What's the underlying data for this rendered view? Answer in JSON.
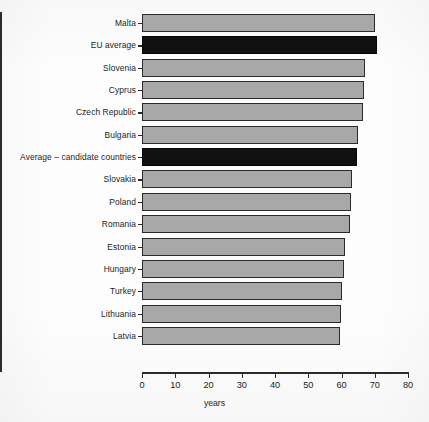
{
  "chart_data": {
    "type": "bar",
    "orientation": "horizontal",
    "title": "",
    "xlabel": "years",
    "ylabel": "",
    "xlim": [
      0,
      80
    ],
    "xticks": [
      0,
      10,
      20,
      30,
      40,
      50,
      60,
      70,
      80
    ],
    "grid": false,
    "legend": null,
    "categories": [
      "Malta",
      "EU average",
      "Slovenia",
      "Cyprus",
      "Czech Republic",
      "Bulgaria",
      "Average – candidate countries",
      "Slovakia",
      "Poland",
      "Romania",
      "Estonia",
      "Hungary",
      "Turkey",
      "Lithuania",
      "Latvia"
    ],
    "values": [
      70.2,
      70.6,
      67.2,
      66.9,
      66.4,
      64.9,
      64.8,
      63.1,
      62.8,
      62.5,
      61.2,
      60.7,
      60.1,
      59.8,
      59.4
    ],
    "highlight": [
      "EU average",
      "Average – candidate countries"
    ],
    "colors": {
      "bar": "#a8a8a8",
      "highlight_bar": "#111111",
      "bar_border": "#2b2b2b",
      "axis": "#2b2b2b",
      "background": "#fdfdfd",
      "text": "#1c1c1c"
    },
    "bars": [
      {
        "label": "Malta",
        "value": 70.2,
        "style": "gray"
      },
      {
        "label": "EU average",
        "value": 70.6,
        "style": "black"
      },
      {
        "label": "Slovenia",
        "value": 67.2,
        "style": "gray"
      },
      {
        "label": "Cyprus",
        "value": 66.9,
        "style": "gray"
      },
      {
        "label": "Czech Republic",
        "value": 66.4,
        "style": "gray"
      },
      {
        "label": "Bulgaria",
        "value": 64.9,
        "style": "gray"
      },
      {
        "label": "Average – candidate countries",
        "value": 64.8,
        "style": "black"
      },
      {
        "label": "Slovakia",
        "value": 63.1,
        "style": "gray"
      },
      {
        "label": "Poland",
        "value": 62.8,
        "style": "gray"
      },
      {
        "label": "Romania",
        "value": 62.5,
        "style": "gray"
      },
      {
        "label": "Estonia",
        "value": 61.2,
        "style": "gray"
      },
      {
        "label": "Hungary",
        "value": 60.7,
        "style": "gray"
      },
      {
        "label": "Turkey",
        "value": 60.1,
        "style": "gray"
      },
      {
        "label": "Lithuania",
        "value": 59.8,
        "style": "gray"
      },
      {
        "label": "Latvia",
        "value": 59.4,
        "style": "gray"
      }
    ]
  }
}
